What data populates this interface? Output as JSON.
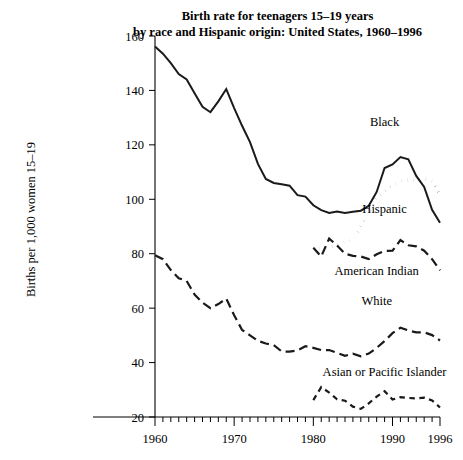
{
  "chart_data": {
    "type": "line",
    "title": "Birth rate for teenagers 15–19 years by race and Hispanic origin: United States, 1960–1996",
    "title_lines": [
      "Birth rate for teenagers 15–19 years",
      "by race and Hispanic origin: United States, 1960–1996"
    ],
    "xlabel": "",
    "ylabel": "Births per 1,000 women 15–19",
    "xlim": [
      1960,
      1996
    ],
    "ylim": [
      20,
      160
    ],
    "ytick_labels": [
      "20",
      "40",
      "60",
      "80",
      "100",
      "120",
      "140",
      "160"
    ],
    "ytick_values": [
      20,
      40,
      60,
      80,
      100,
      120,
      140,
      160
    ],
    "xtick_labels": [
      "1960",
      "1970",
      "1980",
      "1990",
      "1996"
    ],
    "xtick_values": [
      1960,
      1970,
      1980,
      1990,
      1996
    ],
    "xminor_step": 1,
    "grid": false,
    "legend_position": "inline-annotations",
    "series": [
      {
        "name": "Black",
        "style": "solid",
        "label_x": 1989,
        "label_y": 127,
        "x": [
          1960,
          1961,
          1962,
          1963,
          1964,
          1965,
          1966,
          1967,
          1968,
          1969,
          1970,
          1971,
          1972,
          1973,
          1974,
          1975,
          1976,
          1977,
          1978,
          1979,
          1980,
          1981,
          1982,
          1983,
          1984,
          1985,
          1986,
          1987,
          1988,
          1989,
          1990,
          1991,
          1992,
          1993,
          1994,
          1995,
          1996
        ],
        "values": [
          156.1,
          153.5,
          150.0,
          146.0,
          144.0,
          139.0,
          134.0,
          132.0,
          136.0,
          140.5,
          133.5,
          127.0,
          121.0,
          113.0,
          107.5,
          106.0,
          105.5,
          105.0,
          101.5,
          101.0,
          97.8,
          96.0,
          95.0,
          95.5,
          95.0,
          95.4,
          95.8,
          97.6,
          102.7,
          111.5,
          112.8,
          115.5,
          114.7,
          108.6,
          104.5,
          96.1,
          91.4
        ]
      },
      {
        "name": "Hispanic",
        "style": "dotted",
        "label_x": 1989,
        "label_y": 95,
        "x": [
          1980,
          1981,
          1982,
          1983,
          1984,
          1985,
          1986,
          1987,
          1988,
          1989,
          1990,
          1991,
          1992,
          1993,
          1994,
          1995,
          1996
        ],
        "values": [
          82.2,
          82.0,
          82.5,
          83.0,
          84.5,
          85.0,
          90.5,
          95.0,
          100.8,
          103.0,
          105.0,
          106.7,
          107.1,
          106.8,
          107.7,
          106.7,
          101.6
        ]
      },
      {
        "name": "American Indian",
        "style": "dashed",
        "label_x": 1988,
        "label_y": 72,
        "x": [
          1980,
          1981,
          1982,
          1983,
          1984,
          1985,
          1986,
          1987,
          1988,
          1989,
          1990,
          1991,
          1992,
          1993,
          1994,
          1995,
          1996
        ],
        "values": [
          82.2,
          79.0,
          85.6,
          83.0,
          80.0,
          79.2,
          79.0,
          78.0,
          79.8,
          81.0,
          81.1,
          85.0,
          83.1,
          82.7,
          81.1,
          78.0,
          73.9
        ]
      },
      {
        "name": "White",
        "style": "dashed",
        "label_x": 1988,
        "label_y": 61,
        "x": [
          1960,
          1961,
          1962,
          1963,
          1964,
          1965,
          1966,
          1967,
          1968,
          1969,
          1970,
          1971,
          1972,
          1973,
          1974,
          1975,
          1976,
          1977,
          1978,
          1979,
          1980,
          1981,
          1982,
          1983,
          1984,
          1985,
          1986,
          1987,
          1988,
          1989,
          1990,
          1991,
          1992,
          1993,
          1994,
          1995,
          1996
        ],
        "values": [
          79.4,
          78.0,
          74.0,
          71.0,
          70.0,
          65.0,
          62.0,
          60.0,
          61.5,
          63.5,
          57.4,
          52.0,
          50.0,
          48.0,
          47.0,
          46.4,
          44.1,
          44.0,
          44.5,
          46.0,
          45.4,
          44.6,
          44.6,
          43.6,
          42.5,
          43.3,
          42.3,
          43.3,
          45.4,
          47.9,
          50.8,
          52.8,
          51.8,
          51.1,
          51.1,
          50.1,
          48.1
        ]
      },
      {
        "name": "Asian or Pacific Islander",
        "style": "short-dashed",
        "label_x": 1989,
        "label_y": 35,
        "x": [
          1980,
          1981,
          1982,
          1983,
          1984,
          1985,
          1986,
          1987,
          1988,
          1989,
          1990,
          1991,
          1992,
          1993,
          1994,
          1995,
          1996
        ],
        "values": [
          26.2,
          31.0,
          29.0,
          26.5,
          26.0,
          23.8,
          23.0,
          25.0,
          27.5,
          29.5,
          26.4,
          27.3,
          27.0,
          26.8,
          27.1,
          26.1,
          23.5
        ]
      }
    ]
  },
  "labels": {
    "black": "Black",
    "hispanic": "Hispanic",
    "american_indian": "American Indian",
    "white": "White",
    "asian_pacific": "Asian or Pacific Islander"
  },
  "colors": {
    "ink": "#000000",
    "line": "#1a1a1a",
    "background": "#ffffff"
  }
}
